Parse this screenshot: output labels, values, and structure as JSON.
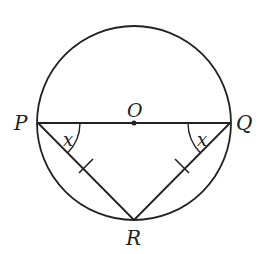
{
  "diagram": {
    "title": "",
    "points": {
      "P": {
        "label": "P",
        "x": 38,
        "y": 123
      },
      "Q": {
        "label": "Q",
        "x": 230,
        "y": 123
      },
      "O": {
        "label": "O",
        "x": 134,
        "y": 123
      },
      "R": {
        "label": "R",
        "x": 134,
        "y": 220
      }
    },
    "circle": {
      "cx": 134,
      "cy": 123,
      "r": 97
    },
    "angles": {
      "at_P": {
        "label": "x"
      },
      "at_Q": {
        "label": "x"
      }
    },
    "segments": [
      "PQ (diameter)",
      "PR",
      "QR"
    ],
    "equal_marks": [
      "PR",
      "QR"
    ],
    "stroke_color": "#222222"
  }
}
